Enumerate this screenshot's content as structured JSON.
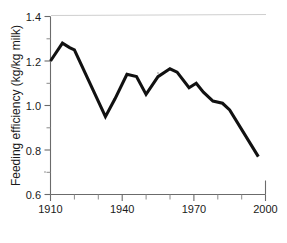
{
  "chart_data": {
    "type": "line",
    "title": "",
    "subtitle": "",
    "xlabel": "",
    "ylabel": "Feeding efficiency (kg/kg milk)",
    "xlim": [
      1910,
      2000
    ],
    "ylim": [
      0.6,
      1.4
    ],
    "grid": false,
    "legend": null,
    "x_ticks": [
      1910,
      1920,
      1930,
      1940,
      1950,
      1960,
      1970,
      1980,
      1990,
      2000
    ],
    "x_tick_labels": [
      "1910",
      "",
      "",
      "1940",
      "",
      "",
      "1970",
      "",
      "",
      "2000"
    ],
    "x_major_labels": [
      "1910",
      "1940",
      "1970",
      "2000"
    ],
    "y_ticks": [
      0.6,
      0.7,
      0.8,
      0.9,
      1.0,
      1.1,
      1.2,
      1.3,
      1.4
    ],
    "y_tick_labels": [
      "0.6",
      "",
      "0.8",
      "",
      "1.0",
      "",
      "1.2",
      "",
      "1.4"
    ],
    "y_major_labels": [
      "0.6",
      "0.8",
      "1.0",
      "1.2",
      "1.4"
    ],
    "series": [
      {
        "name": "Feeding efficiency",
        "color": "#111111",
        "x": [
          1910,
          1915,
          1918,
          1920,
          1933,
          1937,
          1942,
          1946,
          1950,
          1955,
          1960,
          1963,
          1968,
          1971,
          1974,
          1978,
          1982,
          1985,
          1997
        ],
        "values": [
          1.2,
          1.28,
          1.26,
          1.25,
          0.95,
          1.03,
          1.14,
          1.13,
          1.05,
          1.13,
          1.165,
          1.15,
          1.08,
          1.1,
          1.06,
          1.02,
          1.01,
          0.98,
          0.77
        ]
      }
    ]
  },
  "axis": {
    "y_title": "Feeding efficiency (kg/kg milk)",
    "x_title": ""
  },
  "labels": {
    "y_0_6": "0.6",
    "y_0_8": "0.8",
    "y_1_0": "1.0",
    "y_1_2": "1.2",
    "y_1_4": "1.4",
    "x_1910": "1910",
    "x_1940": "1940",
    "x_1970": "1970",
    "x_2000": "2000"
  },
  "colors": {
    "line": "#111111",
    "axis": "#6b6b6b",
    "text": "#1a1a1a",
    "background": "#ffffff"
  }
}
